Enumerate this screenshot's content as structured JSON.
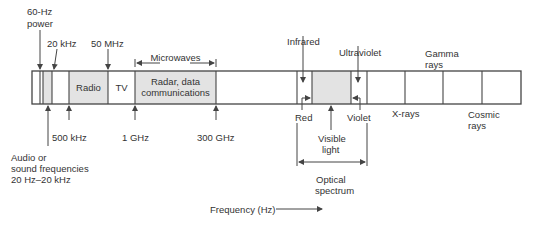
{
  "diagram": {
    "bar": {
      "segments": [
        {
          "name": "power-band",
          "label": ""
        },
        {
          "name": "audio-band",
          "label": ""
        },
        {
          "name": "low-freq-band",
          "label": ""
        },
        {
          "name": "radio-band",
          "label": "Radio"
        },
        {
          "name": "tv-band",
          "label": "TV"
        },
        {
          "name": "microwave-band",
          "label_line1": "Radar, data",
          "label_line2": "communications"
        },
        {
          "name": "sub-infrared-band",
          "label": ""
        },
        {
          "name": "infrared-band",
          "label": ""
        },
        {
          "name": "visible-band",
          "label": ""
        },
        {
          "name": "ultraviolet-band",
          "label": ""
        },
        {
          "name": "xray-band",
          "label": ""
        },
        {
          "name": "gamma-band",
          "label": ""
        },
        {
          "name": "cosmic-band",
          "label": ""
        }
      ]
    },
    "top_labels": {
      "power_line1": "60-Hz",
      "power_line2": "power",
      "khz20": "20 kHz",
      "mhz50": "50 MHz",
      "microwaves": "Microwaves",
      "infrared": "Infrared",
      "ultraviolet": "Ultraviolet",
      "gamma_line1": "Gamma",
      "gamma_line2": "rays"
    },
    "bottom_labels": {
      "khz500": "500 kHz",
      "ghz1": "1 GHz",
      "ghz300": "300 GHz",
      "audio_line1": "Audio or",
      "audio_line2": "sound frequencies",
      "audio_line3": "20 Hz–20 kHz",
      "red": "Red",
      "violet": "Violet",
      "visible_line1": "Visible",
      "visible_line2": "light",
      "optical_line1": "Optical",
      "optical_line2": "spectrum",
      "xrays": "X-rays",
      "cosmic_line1": "Cosmic",
      "cosmic_line2": "rays"
    },
    "axis": {
      "label": "Frequency (Hz)"
    },
    "colors": {
      "line": "#444444",
      "shade": "#e3e3e3",
      "text": "#333333"
    }
  }
}
